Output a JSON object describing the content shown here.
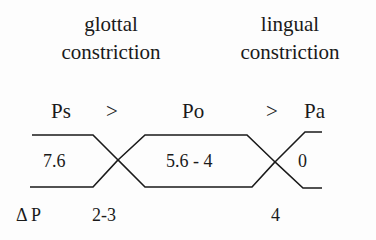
{
  "headings": {
    "glottal": [
      "glottal",
      "constriction"
    ],
    "lingual": [
      "lingual",
      "constriction"
    ]
  },
  "pressures": {
    "ps": "Ps",
    "gt1": ">",
    "po": "Po",
    "gt2": ">",
    "pa": "Pa"
  },
  "values": {
    "subglottal": "7.6",
    "oral": "5.6 - 4",
    "atmospheric": "0"
  },
  "delta": {
    "label": "Δ P",
    "glottal": "2-3",
    "lingual": "4"
  },
  "colors": {
    "line": "#1a1a1a",
    "background": "#fdfdfd"
  }
}
